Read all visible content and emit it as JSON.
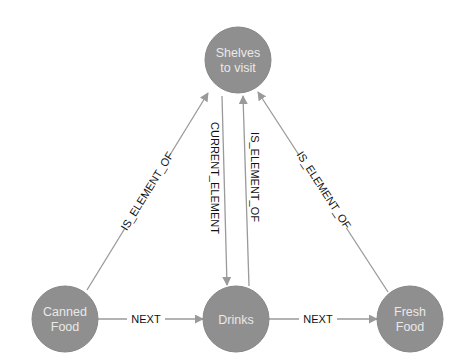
{
  "diagram": {
    "type": "graph",
    "colors": {
      "node_fill": "#8f8f8f",
      "node_text": "#e9e9e9",
      "edge": "#9a9a9a",
      "edge_label": "#111111",
      "background": "#ffffff"
    },
    "nodes": [
      {
        "id": "shelves",
        "line1": "Shelves",
        "line2": "to visit"
      },
      {
        "id": "canned",
        "line1": "Canned",
        "line2": "Food"
      },
      {
        "id": "drinks",
        "line1": "Drinks",
        "line2": ""
      },
      {
        "id": "fresh",
        "line1": "Fresh",
        "line2": "Food"
      }
    ],
    "edges": [
      {
        "from": "canned",
        "to": "shelves",
        "label": "IS_ELEMENT_OF"
      },
      {
        "from": "shelves",
        "to": "drinks",
        "label": "CURRENT_ELEMENT"
      },
      {
        "from": "drinks",
        "to": "shelves",
        "label": "IS_ELEMENT_OF"
      },
      {
        "from": "fresh",
        "to": "shelves",
        "label": "IS_ELEMENT_OF"
      },
      {
        "from": "canned",
        "to": "drinks",
        "label": "NEXT"
      },
      {
        "from": "drinks",
        "to": "fresh",
        "label": "NEXT"
      }
    ]
  }
}
